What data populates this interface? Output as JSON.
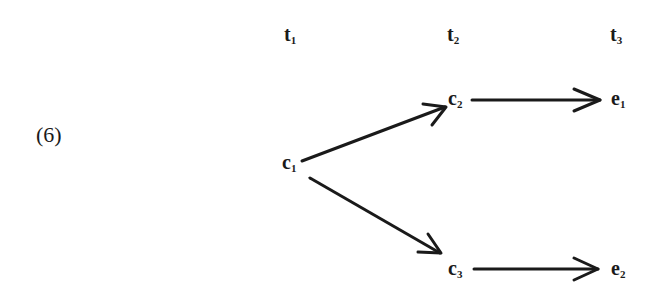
{
  "example_number": "(6)",
  "time_labels": [
    {
      "base": "t",
      "sub": "1"
    },
    {
      "base": "t",
      "sub": "2"
    },
    {
      "base": "t",
      "sub": "3"
    }
  ],
  "nodes": {
    "c1": {
      "base": "c",
      "sub": "1"
    },
    "c2": {
      "base": "c",
      "sub": "2"
    },
    "c3": {
      "base": "c",
      "sub": "3"
    },
    "e1": {
      "base": "e",
      "sub": "1"
    },
    "e2": {
      "base": "e",
      "sub": "2"
    }
  },
  "edges": [
    {
      "from": "c1",
      "to": "c2"
    },
    {
      "from": "c1",
      "to": "c3"
    },
    {
      "from": "c2",
      "to": "e1"
    },
    {
      "from": "c3",
      "to": "e2"
    }
  ],
  "colors": {
    "ink": "#1a1a1a",
    "background": "#ffffff"
  }
}
